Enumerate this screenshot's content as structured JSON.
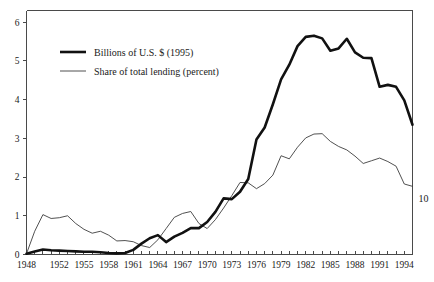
{
  "chart_data": {
    "type": "line",
    "title": "",
    "xlabel": "",
    "ylabel": "",
    "xlim": [
      1948,
      1995
    ],
    "ylim": [
      0,
      6.3
    ],
    "grid": false,
    "legend_position": "upper-left-inside",
    "y_ticks": [
      "0",
      "1",
      "2",
      "3",
      "4",
      "5",
      "6"
    ],
    "y_tick_values": [
      0,
      1,
      2,
      3,
      4,
      5,
      6
    ],
    "x_ticks": [
      "1948",
      "1952",
      "1955",
      "1958",
      "1961",
      "1964",
      "1967",
      "1970",
      "1973",
      "1976",
      "1979",
      "1982",
      "1985",
      "1988",
      "1991",
      "1994"
    ],
    "x_tick_values": [
      1948,
      1952,
      1955,
      1958,
      1961,
      1964,
      1967,
      1970,
      1973,
      1976,
      1979,
      1982,
      1985,
      1988,
      1991,
      1994
    ],
    "x_minor_every": 1,
    "annotations": [
      {
        "text": "10",
        "position": "right-outside",
        "value": 1.45
      }
    ],
    "x": [
      1948,
      1949,
      1950,
      1951,
      1952,
      1953,
      1954,
      1955,
      1956,
      1957,
      1958,
      1959,
      1960,
      1961,
      1962,
      1963,
      1964,
      1965,
      1966,
      1967,
      1968,
      1969,
      1970,
      1971,
      1972,
      1973,
      1974,
      1975,
      1976,
      1977,
      1978,
      1979,
      1980,
      1981,
      1982,
      1983,
      1984,
      1985,
      1986,
      1987,
      1988,
      1989,
      1990,
      1991,
      1992,
      1993,
      1994,
      1995
    ],
    "series": [
      {
        "name": "Billions of U.S. $ (1995)",
        "style": "bold",
        "values": [
          0.02,
          0.08,
          0.13,
          0.11,
          0.1,
          0.09,
          0.08,
          0.07,
          0.07,
          0.06,
          0.04,
          0.03,
          0.04,
          0.12,
          0.28,
          0.42,
          0.5,
          0.32,
          0.46,
          0.56,
          0.68,
          0.68,
          0.84,
          1.1,
          1.45,
          1.43,
          1.62,
          1.95,
          2.97,
          3.28,
          3.88,
          4.52,
          4.9,
          5.38,
          5.62,
          5.65,
          5.58,
          5.26,
          5.32,
          5.57,
          5.22,
          5.08,
          5.07,
          4.33,
          4.38,
          4.33,
          3.98,
          3.35
        ]
      },
      {
        "name": "Share of total lending (percent)",
        "style": "thin",
        "values": [
          0.02,
          0.6,
          1.03,
          0.93,
          0.95,
          1.0,
          0.8,
          0.65,
          0.55,
          0.6,
          0.5,
          0.35,
          0.36,
          0.33,
          0.23,
          0.18,
          0.38,
          0.67,
          0.96,
          1.06,
          1.11,
          0.8,
          0.67,
          0.9,
          1.2,
          1.52,
          1.86,
          1.85,
          1.7,
          1.83,
          2.05,
          2.55,
          2.47,
          2.77,
          3.01,
          3.11,
          3.12,
          2.92,
          2.79,
          2.7,
          2.54,
          2.35,
          2.42,
          2.49,
          2.4,
          2.28,
          1.82,
          1.76
        ]
      }
    ]
  },
  "legend": {
    "entries": [
      {
        "label": "Billions of U.S. $ (1995)",
        "style": "bold"
      },
      {
        "label": "Share of total lending (percent)",
        "style": "thin"
      }
    ]
  },
  "right_label": "10"
}
